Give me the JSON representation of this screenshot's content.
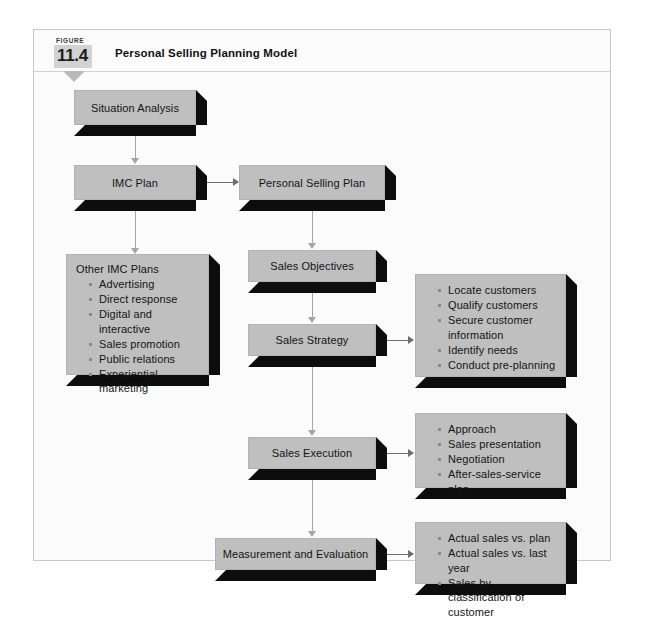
{
  "figure": {
    "kicker": "FIGURE",
    "number": "11.4",
    "title": "Personal Selling Planning Model",
    "accent_color": "#bfbfbf",
    "shadow_color": "#0d0d0d",
    "frame_border_color": "#c8c8c8"
  },
  "nodes": {
    "situation_analysis": {
      "label": "Situation Analysis"
    },
    "imc_plan": {
      "label": "IMC Plan"
    },
    "personal_selling_plan": {
      "label": "Personal Selling Plan"
    },
    "other_imc_plans": {
      "title": "Other IMC Plans",
      "items": [
        "Advertising",
        "Direct response",
        "Digital and interactive",
        "Sales promotion",
        "Public relations",
        "Experiential marketing"
      ]
    },
    "sales_objectives": {
      "label": "Sales Objectives"
    },
    "sales_strategy": {
      "label": "Sales Strategy"
    },
    "sales_strategy_detail": {
      "items": [
        "Locate customers",
        "Qualify customers",
        "Secure customer information",
        "Identify needs",
        "Conduct pre-planning"
      ]
    },
    "sales_execution": {
      "label": "Sales Execution"
    },
    "sales_execution_detail": {
      "items": [
        "Approach",
        "Sales presentation",
        "Negotiation",
        "After-sales-service plan"
      ]
    },
    "measurement_and_evaluation": {
      "label": "Measurement and Evaluation"
    },
    "measurement_detail": {
      "items": [
        "Actual sales vs. plan",
        "Actual sales vs. last year",
        "Sales by classification of customer"
      ]
    }
  }
}
